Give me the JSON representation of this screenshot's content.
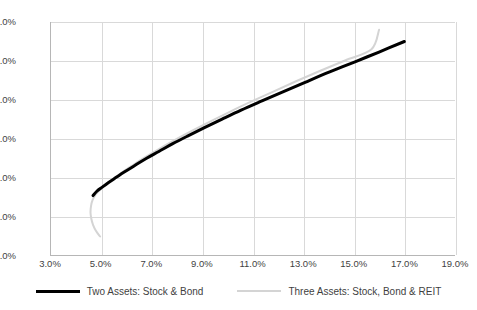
{
  "chart_data": {
    "type": "line",
    "title": "",
    "xlabel": "",
    "ylabel": "",
    "xlim": [
      3.0,
      19.0
    ],
    "ylim": [
      6.0,
      12.0
    ],
    "x_tick_step": 2.0,
    "y_tick_step": 1.0,
    "grid": true,
    "legend_position": "bottom-center",
    "x_tick_labels": [
      "3.0%",
      "5.0%",
      "7.0%",
      "9.0%",
      "11.0%",
      "13.0%",
      "15.0%",
      "17.0%",
      "19.0%"
    ],
    "y_tick_labels": [
      "6.0%",
      "7.0%",
      "8.0%",
      "9.0%",
      "10.0%",
      "11.0%",
      "12.0%"
    ],
    "x_tick_values": [
      3.0,
      5.0,
      7.0,
      9.0,
      11.0,
      13.0,
      15.0,
      17.0,
      19.0
    ],
    "y_tick_values": [
      6.0,
      7.0,
      8.0,
      9.0,
      10.0,
      11.0,
      12.0
    ],
    "series": [
      {
        "name": "Two Assets: Stock & Bond",
        "color": "#000000",
        "width": 3.0,
        "points": [
          [
            4.7,
            7.55
          ],
          [
            4.85,
            7.66
          ],
          [
            5.05,
            7.76
          ],
          [
            5.3,
            7.88
          ],
          [
            5.6,
            8.01
          ],
          [
            5.95,
            8.16
          ],
          [
            6.35,
            8.32
          ],
          [
            6.8,
            8.5
          ],
          [
            7.3,
            8.68
          ],
          [
            7.85,
            8.88
          ],
          [
            8.45,
            9.08
          ],
          [
            9.1,
            9.29
          ],
          [
            9.8,
            9.51
          ],
          [
            10.55,
            9.74
          ],
          [
            11.35,
            9.97
          ],
          [
            12.2,
            10.21
          ],
          [
            13.1,
            10.46
          ],
          [
            14.05,
            10.72
          ],
          [
            15.05,
            10.98
          ],
          [
            16.0,
            11.23
          ],
          [
            17.0,
            11.5
          ]
        ]
      },
      {
        "name": "Three Assets: Stock, Bond & REIT",
        "color": "#d4d4d4",
        "width": 2.0,
        "points": [
          [
            4.98,
            6.5
          ],
          [
            4.82,
            6.64
          ],
          [
            4.7,
            6.8
          ],
          [
            4.63,
            6.96
          ],
          [
            4.6,
            7.12
          ],
          [
            4.62,
            7.28
          ],
          [
            4.68,
            7.43
          ],
          [
            4.8,
            7.57
          ],
          [
            4.98,
            7.7
          ],
          [
            5.22,
            7.84
          ],
          [
            5.52,
            7.99
          ],
          [
            5.88,
            8.16
          ],
          [
            6.3,
            8.34
          ],
          [
            6.78,
            8.54
          ],
          [
            7.32,
            8.75
          ],
          [
            7.92,
            8.97
          ],
          [
            8.58,
            9.2
          ],
          [
            9.3,
            9.44
          ],
          [
            10.08,
            9.69
          ],
          [
            10.92,
            9.95
          ],
          [
            11.8,
            10.21
          ],
          [
            12.72,
            10.48
          ],
          [
            13.68,
            10.75
          ],
          [
            14.68,
            11.02
          ],
          [
            15.7,
            11.3
          ],
          [
            16.0,
            11.8
          ]
        ]
      }
    ]
  },
  "legend": {
    "items": [
      {
        "label": "Two Assets: Stock & Bond",
        "swatch": "black"
      },
      {
        "label": "Three Assets: Stock, Bond & REIT",
        "swatch": "gray"
      }
    ]
  },
  "colors": {
    "series_two_assets": "#000000",
    "series_three_assets": "#d4d4d4",
    "gridline": "#d9d9d9",
    "axis": "#b6b6b6",
    "text": "#3f3f3f",
    "background": "#ffffff"
  }
}
